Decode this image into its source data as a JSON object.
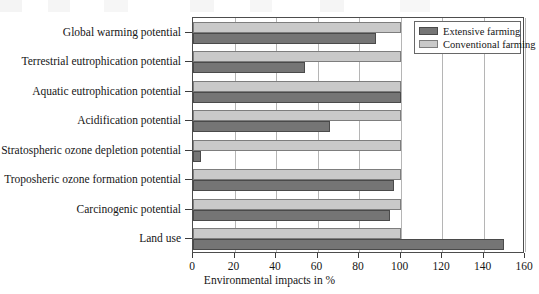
{
  "chart_data": {
    "type": "bar",
    "orientation": "horizontal",
    "title": "",
    "xlabel": "Environmental impacts in %",
    "ylabel": "",
    "xlim": [
      0,
      160
    ],
    "xticks": [
      0,
      20,
      40,
      60,
      80,
      100,
      120,
      140,
      160
    ],
    "grid": true,
    "legend_position": "top-right-inside",
    "categories": [
      "Global warming potential",
      "Terrestrial eutrophication potential",
      "Aquatic eutrophication potential",
      "Acidification potential",
      "Stratospheric ozone depletion potential",
      "Troposheric ozone formation potential",
      "Carcinogenic potential",
      "Land use"
    ],
    "series": [
      {
        "name": "Extensive farming",
        "color": "#757575",
        "values": [
          88,
          54,
          100,
          66,
          4,
          97,
          95,
          150
        ]
      },
      {
        "name": "Conventional farming",
        "color": "#c9c9c9",
        "values": [
          100,
          100,
          100,
          100,
          100,
          100,
          100,
          100
        ]
      }
    ]
  },
  "legend": {
    "entries": [
      {
        "label": "Extensive farming"
      },
      {
        "label": "Conventional farming"
      }
    ]
  },
  "axis": {
    "x_title": "Environmental impacts in %"
  }
}
